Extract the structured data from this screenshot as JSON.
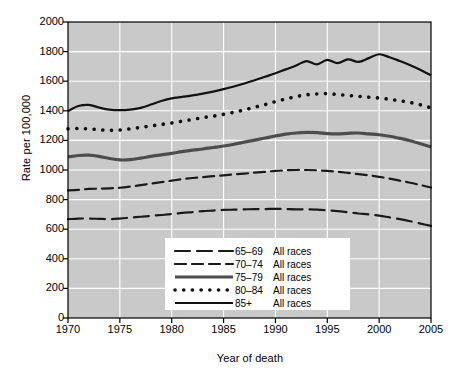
{
  "chart_data": {
    "type": "line",
    "title": "",
    "xlabel": "Year of death",
    "ylabel": "Rate per 100,000",
    "xlim": [
      1970,
      2005
    ],
    "ylim": [
      0,
      2000
    ],
    "xticks": [
      1970,
      1975,
      1980,
      1985,
      1990,
      1995,
      2000,
      2005
    ],
    "yticks": [
      0,
      200,
      400,
      600,
      800,
      1000,
      1200,
      1400,
      1600,
      1800,
      2000
    ],
    "grid": true,
    "legend_position": "lower-center",
    "plot_background": "#c9c9c9",
    "gridline_color": "#ffffff",
    "x": [
      1970,
      1971,
      1972,
      1973,
      1974,
      1975,
      1976,
      1977,
      1978,
      1979,
      1980,
      1981,
      1982,
      1983,
      1984,
      1985,
      1986,
      1987,
      1988,
      1989,
      1990,
      1991,
      1992,
      1993,
      1994,
      1995,
      1996,
      1997,
      1998,
      1999,
      2000,
      2001,
      2002,
      2003,
      2004,
      2005
    ],
    "series": [
      {
        "name": "65-69",
        "label_age": "65–69",
        "label_races": "All races",
        "style": "long-dash",
        "color": "#1a1a1a",
        "width": 2.2,
        "values": [
          668,
          672,
          672,
          670,
          668,
          672,
          678,
          684,
          690,
          696,
          702,
          710,
          716,
          722,
          726,
          730,
          732,
          734,
          736,
          736,
          738,
          736,
          734,
          734,
          732,
          728,
          722,
          714,
          706,
          700,
          692,
          680,
          668,
          654,
          638,
          622
        ]
      },
      {
        "name": "70-74",
        "label_age": "70–74",
        "label_races": "All races",
        "style": "dash",
        "color": "#1a1a1a",
        "width": 2.2,
        "values": [
          862,
          866,
          872,
          874,
          876,
          880,
          888,
          898,
          908,
          918,
          928,
          938,
          946,
          952,
          958,
          964,
          970,
          976,
          982,
          988,
          994,
          998,
          1000,
          1000,
          998,
          994,
          988,
          980,
          972,
          964,
          954,
          942,
          928,
          914,
          898,
          882
        ]
      },
      {
        "name": "75-79",
        "label_age": "75–79",
        "label_races": "All races",
        "style": "solid-thick",
        "color": "#4d4d4d",
        "width": 3.2,
        "values": [
          1088,
          1098,
          1100,
          1092,
          1078,
          1068,
          1070,
          1080,
          1092,
          1102,
          1112,
          1124,
          1134,
          1142,
          1152,
          1162,
          1174,
          1188,
          1202,
          1216,
          1230,
          1242,
          1250,
          1254,
          1252,
          1246,
          1244,
          1248,
          1250,
          1244,
          1238,
          1228,
          1214,
          1198,
          1178,
          1156
        ]
      },
      {
        "name": "80-84",
        "label_age": "80–84",
        "label_races": "All races",
        "style": "dotted",
        "color": "#111111",
        "width": 3.6,
        "values": [
          1278,
          1280,
          1278,
          1272,
          1268,
          1270,
          1278,
          1288,
          1298,
          1308,
          1318,
          1330,
          1342,
          1354,
          1364,
          1376,
          1390,
          1406,
          1424,
          1442,
          1462,
          1480,
          1496,
          1508,
          1514,
          1516,
          1510,
          1504,
          1498,
          1492,
          1486,
          1478,
          1468,
          1456,
          1440,
          1420
        ]
      },
      {
        "name": "85+",
        "label_age": "85+",
        "label_races": "All races",
        "style": "solid",
        "color": "#111111",
        "width": 2.2,
        "values": [
          1398,
          1432,
          1440,
          1422,
          1408,
          1404,
          1408,
          1420,
          1442,
          1466,
          1484,
          1494,
          1504,
          1516,
          1530,
          1546,
          1564,
          1584,
          1606,
          1630,
          1654,
          1680,
          1706,
          1736,
          1714,
          1744,
          1722,
          1748,
          1730,
          1756,
          1782,
          1762,
          1736,
          1708,
          1676,
          1640
        ]
      }
    ]
  },
  "axes": {
    "ylabel_text": "Rate per 100,000",
    "xlabel_text": "Year of death"
  }
}
